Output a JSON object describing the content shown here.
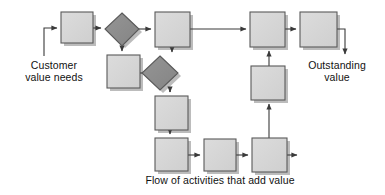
{
  "diagram": {
    "type": "flowchart",
    "title": "Flow of activities that add value",
    "colors": {
      "process_fill": "#d4d4d4",
      "process_stroke": "#5a5a5a",
      "decision_fill": "#8c8c8c",
      "decision_stroke": "#5a5a5a",
      "line": "#3a3a3a",
      "shadow": "#9a9a9a",
      "text": "#111111",
      "background": "#ffffff"
    },
    "labels": {
      "input": {
        "line1": "Customer",
        "line2": "value needs"
      },
      "output": {
        "line1": "Outstanding",
        "line2": "value"
      },
      "caption": "Flow of activities that add value"
    },
    "nodes": [
      {
        "id": "p1",
        "shape": "process",
        "x": 61,
        "y": 12,
        "w": 32,
        "h": 31,
        "label": ""
      },
      {
        "id": "d1",
        "shape": "decision",
        "cx": 122,
        "cy": 29,
        "rx": 17,
        "ry": 16,
        "label": ""
      },
      {
        "id": "p2",
        "shape": "process",
        "x": 155,
        "y": 12,
        "w": 35,
        "h": 35,
        "label": ""
      },
      {
        "id": "p3",
        "shape": "process",
        "x": 107,
        "y": 55,
        "w": 33,
        "h": 33,
        "label": ""
      },
      {
        "id": "d2",
        "shape": "decision",
        "cx": 160,
        "cy": 73,
        "rx": 18,
        "ry": 17,
        "label": ""
      },
      {
        "id": "p4",
        "shape": "process",
        "x": 155,
        "y": 96,
        "w": 33,
        "h": 34,
        "label": ""
      },
      {
        "id": "p5",
        "shape": "process",
        "x": 155,
        "y": 138,
        "w": 33,
        "h": 33,
        "label": ""
      },
      {
        "id": "p6",
        "shape": "process",
        "x": 204,
        "y": 139,
        "w": 32,
        "h": 32,
        "label": ""
      },
      {
        "id": "p7",
        "shape": "process",
        "x": 252,
        "y": 138,
        "w": 35,
        "h": 34,
        "label": ""
      },
      {
        "id": "p8",
        "shape": "process",
        "x": 251,
        "y": 66,
        "w": 34,
        "h": 34,
        "label": ""
      },
      {
        "id": "p9",
        "shape": "process",
        "x": 250,
        "y": 12,
        "w": 35,
        "h": 35,
        "label": ""
      },
      {
        "id": "p10",
        "shape": "process",
        "x": 300,
        "y": 12,
        "w": 37,
        "h": 35,
        "label": ""
      }
    ],
    "edges": [
      {
        "from": "input",
        "to": "p1",
        "kind": "elbow-up-right"
      },
      {
        "from": "p1",
        "to": "d1",
        "kind": "right"
      },
      {
        "from": "d1",
        "to": "p2",
        "kind": "right"
      },
      {
        "from": "d1",
        "to": "p3",
        "kind": "down"
      },
      {
        "from": "p3",
        "to": "d2",
        "kind": "right"
      },
      {
        "from": "p2",
        "to": "d2",
        "kind": "down"
      },
      {
        "from": "d2",
        "to": "p4",
        "kind": "down"
      },
      {
        "from": "p4",
        "to": "p5",
        "kind": "down"
      },
      {
        "from": "p5",
        "to": "p6",
        "kind": "right"
      },
      {
        "from": "p6",
        "to": "p7",
        "kind": "right"
      },
      {
        "from": "p7",
        "to": "stub",
        "kind": "right-stub"
      },
      {
        "from": "p7",
        "to": "p8",
        "kind": "up"
      },
      {
        "from": "p8",
        "to": "p9",
        "kind": "up"
      },
      {
        "from": "p2",
        "to": "p9",
        "kind": "right-long"
      },
      {
        "from": "p9",
        "to": "p10",
        "kind": "right"
      },
      {
        "from": "p10",
        "to": "output",
        "kind": "elbow-right-down"
      }
    ]
  }
}
